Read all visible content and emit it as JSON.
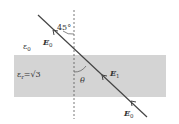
{
  "diagram": {
    "colors": {
      "slab": "#d4d4d4",
      "line": "#444444",
      "dashed": "#555555",
      "text": "#333333",
      "background": "#ffffff"
    },
    "labels": {
      "angle_incident": "45°",
      "field_incident": "E",
      "field_incident_sub": "0",
      "medium_outer": "ε",
      "medium_outer_sub": "0",
      "medium_slab": "ε",
      "medium_slab_sub": "r",
      "medium_slab_value": "=√3",
      "angle_refracted": "θ",
      "field_slab": "E",
      "field_slab_sub": "1",
      "field_exit": "E",
      "field_exit_sub": "0"
    }
  }
}
